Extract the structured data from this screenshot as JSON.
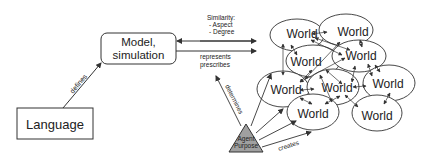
{
  "nodes": {
    "language": "Language",
    "model_line1": "Model,",
    "model_line2": "simulation",
    "agent_line1": "Agent",
    "agent_line2": "Purpose",
    "worlds": [
      "World",
      "World",
      "World",
      "World",
      "World",
      "World",
      "World",
      "World"
    ]
  },
  "edges": {
    "defines": "defines",
    "similarity_title": "Similarity:",
    "similarity_aspect": "- Aspect",
    "similarity_degree": "- Degree",
    "represents": "represents",
    "prescribes": "prescribes",
    "determines": "determines",
    "creates": "creates"
  },
  "colors": {
    "stroke": "#333333",
    "agent_fill": "#a0a0a0",
    "background": "#ffffff"
  }
}
